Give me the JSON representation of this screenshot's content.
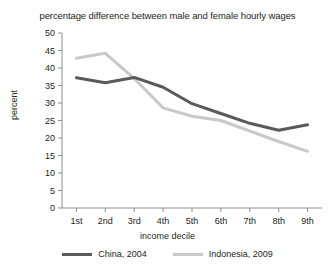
{
  "chart_data": {
    "type": "line",
    "title": "percentage difference between male and female hourly wages",
    "xlabel": "income decile",
    "ylabel": "percent",
    "categories": [
      "1st",
      "2nd",
      "3rd",
      "4th",
      "5th",
      "6th",
      "7th",
      "8th",
      "9th"
    ],
    "ylim": [
      0,
      50
    ],
    "yticks": [
      0,
      5,
      10,
      15,
      20,
      25,
      30,
      35,
      40,
      45,
      50
    ],
    "grid": false,
    "legend_position": "bottom",
    "series": [
      {
        "name": "China, 2004",
        "color": "#5a5a5a",
        "values": [
          37.2,
          35.8,
          37.3,
          34.5,
          29.8,
          27.0,
          24.2,
          22.2,
          23.8
        ]
      },
      {
        "name": "Indonesia, 2009",
        "color": "#c9c9c9",
        "values": [
          42.8,
          44.2,
          37.0,
          28.6,
          26.2,
          25.0,
          22.0,
          19.0,
          16.2
        ]
      }
    ]
  },
  "axis": {
    "tick_labels_y": [
      "50",
      "45",
      "40",
      "35",
      "30",
      "25",
      "20",
      "15",
      "10",
      "5",
      "0"
    ],
    "tick_labels_x": [
      "1st",
      "2nd",
      "3rd",
      "4th",
      "5th",
      "6th",
      "7th",
      "8th",
      "9th"
    ]
  }
}
